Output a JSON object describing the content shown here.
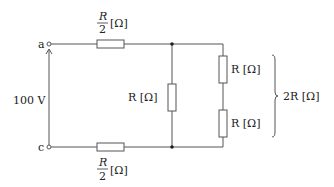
{
  "diagram": {
    "type": "circuit",
    "terminals": {
      "top": "a",
      "bottom": "c"
    },
    "source_label": "100 V",
    "labels": {
      "top_resistor_num": "R",
      "top_resistor_den": "2",
      "top_resistor_unit": "[Ω]",
      "bottom_resistor_num": "R",
      "bottom_resistor_den": "2",
      "bottom_resistor_unit": "[Ω]",
      "middle_resistor": "R [Ω]",
      "right_upper_resistor": "R [Ω]",
      "right_lower_resistor": "R [Ω]",
      "brace_total": "2R [Ω]"
    },
    "colors": {
      "line": "#555555",
      "text": "#222222",
      "background": "#ffffff"
    }
  }
}
